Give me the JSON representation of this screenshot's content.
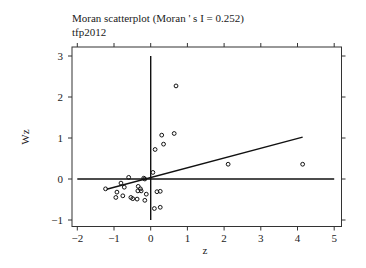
{
  "chart_data": {
    "type": "scatter",
    "title": "Moran scatterplot (Moran ' s I = 0.252)",
    "subtitle": "tfp2012",
    "xlabel": "z",
    "ylabel": "Wz",
    "xlim": [
      -2.2,
      5.2
    ],
    "ylim": [
      -1.15,
      3.2
    ],
    "x_ticks": [
      -2,
      -1,
      0,
      1,
      2,
      3,
      4,
      5
    ],
    "y_ticks": [
      -1,
      0,
      1,
      2,
      3
    ],
    "grid": false,
    "legend": null,
    "moran_i": 0.252,
    "points": [
      {
        "z": 0.69,
        "wz": 2.27
      },
      {
        "z": 0.3,
        "wz": 1.07
      },
      {
        "z": 0.64,
        "wz": 1.11
      },
      {
        "z": 0.35,
        "wz": 0.85
      },
      {
        "z": 0.12,
        "wz": 0.72
      },
      {
        "z": 0.06,
        "wz": 0.16
      },
      {
        "z": 2.11,
        "wz": 0.36
      },
      {
        "z": 4.14,
        "wz": 0.36
      },
      {
        "z": -1.23,
        "wz": -0.24
      },
      {
        "z": -0.81,
        "wz": -0.1
      },
      {
        "z": -0.6,
        "wz": 0.04
      },
      {
        "z": -0.92,
        "wz": -0.32
      },
      {
        "z": -0.72,
        "wz": -0.2
      },
      {
        "z": -0.95,
        "wz": -0.45
      },
      {
        "z": -0.76,
        "wz": -0.41
      },
      {
        "z": -0.54,
        "wz": -0.45
      },
      {
        "z": -0.49,
        "wz": -0.48
      },
      {
        "z": -0.37,
        "wz": -0.49
      },
      {
        "z": -0.34,
        "wz": -0.18
      },
      {
        "z": -0.28,
        "wz": -0.24
      },
      {
        "z": -0.35,
        "wz": -0.29
      },
      {
        "z": -0.26,
        "wz": -0.29
      },
      {
        "z": -0.19,
        "wz": 0.02
      },
      {
        "z": -0.16,
        "wz": 0.0
      },
      {
        "z": -0.12,
        "wz": -0.37
      },
      {
        "z": -0.16,
        "wz": -0.52
      },
      {
        "z": 0.17,
        "wz": -0.31
      },
      {
        "z": 0.26,
        "wz": -0.3
      },
      {
        "z": 0.1,
        "wz": -0.72
      },
      {
        "z": 0.26,
        "wz": -0.69
      }
    ],
    "regression_line": {
      "from": {
        "z": -1.2,
        "wz": -0.25
      },
      "to": {
        "z": 4.14,
        "wz": 1.02
      }
    },
    "reference_lines": {
      "horizontal": {
        "wz": 0,
        "z_from": -2,
        "z_to": 5
      },
      "vertical": {
        "z": 0,
        "wz_from": -1,
        "wz_to": 3
      }
    }
  }
}
